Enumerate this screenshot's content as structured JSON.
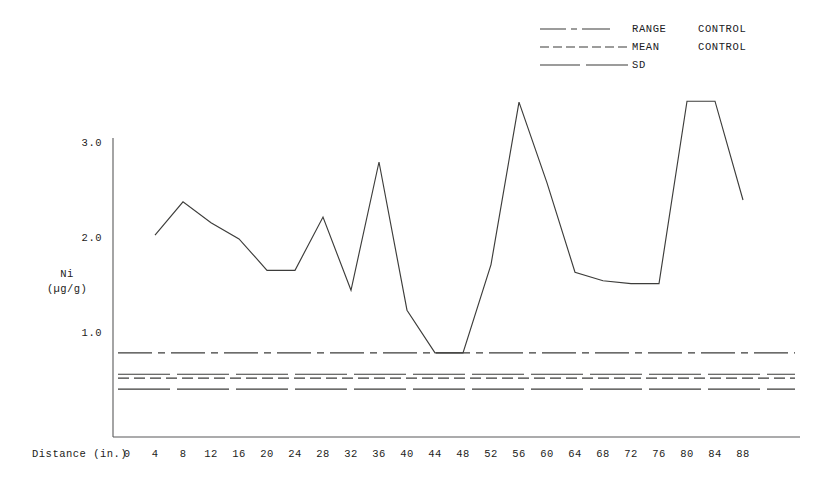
{
  "legend": {
    "items": [
      {
        "label": "RANGE",
        "qualifier": "CONTROL",
        "style": "dash-dot",
        "icon": "line-sample-range"
      },
      {
        "label": "MEAN",
        "qualifier": "CONTROL",
        "style": "dashed",
        "icon": "line-sample-mean"
      },
      {
        "label": "SD",
        "qualifier": "",
        "style": "long-dash",
        "icon": "line-sample-sd"
      }
    ]
  },
  "axes": {
    "y_title_line1": "Ni",
    "y_title_line2": "(µg/g)",
    "y_ticks": [
      "1.0",
      "2.0",
      "3.0"
    ],
    "x_title": "Distance (in.)",
    "x_ticks": [
      "0",
      "4",
      "8",
      "12",
      "16",
      "20",
      "24",
      "28",
      "32",
      "36",
      "40",
      "44",
      "48",
      "52",
      "56",
      "60",
      "64",
      "68",
      "72",
      "76",
      "80",
      "84",
      "88"
    ]
  },
  "chart_data": {
    "type": "line",
    "title": "",
    "xlabel": "Distance (in.)",
    "ylabel": "Ni (µg/g)",
    "xlim": [
      0,
      92
    ],
    "ylim": [
      0,
      3.6
    ],
    "grid": false,
    "legend_position": "top-right",
    "x": [
      4,
      8,
      12,
      16,
      20,
      24,
      28,
      32,
      36,
      40,
      44,
      48,
      52,
      56,
      60,
      64,
      68,
      72,
      76,
      80,
      84,
      88
    ],
    "series": [
      {
        "name": "Ni",
        "style": "solid",
        "values": [
          2.03,
          2.38,
          2.16,
          1.99,
          1.66,
          1.66,
          2.22,
          1.45,
          2.8,
          1.24,
          0.79,
          0.79,
          1.72,
          3.43,
          2.58,
          1.64,
          1.55,
          1.52,
          1.52,
          3.44,
          3.44,
          2.4
        ]
      }
    ],
    "reference_lines": [
      {
        "name": "RANGE CONTROL",
        "value": 0.79,
        "style": "dash-dot"
      },
      {
        "name": "SD upper",
        "value": 0.565,
        "style": "long-dash"
      },
      {
        "name": "MEAN CONTROL",
        "value": 0.525,
        "style": "dashed"
      },
      {
        "name": "SD lower",
        "value": 0.41,
        "style": "long-dash"
      }
    ]
  },
  "colors": {
    "ink": "#333331",
    "axis": "#555553",
    "background": "#ffffff"
  }
}
